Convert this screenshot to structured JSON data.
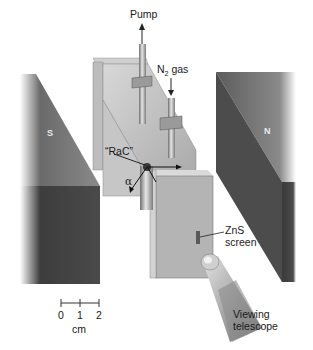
{
  "diagram": {
    "labels": {
      "pump": "Pump",
      "n2_gas_prefix": "N",
      "n2_gas_sub": "2",
      "n2_gas_suffix": " gas",
      "source": "“RaC”",
      "alpha": "α",
      "zns_line1": "ZnS",
      "zns_line2": "screen",
      "telescope_line1": "Viewing",
      "telescope_line2": "telescope",
      "magnet_south": "S",
      "magnet_north": "N"
    },
    "scale_bar": {
      "ticks": [
        "0",
        "1",
        "2"
      ],
      "unit": "cm"
    },
    "colors": {
      "magnet_top": "#7a7a7a",
      "magnet_side": "#4a4a4a",
      "chamber": "#b9b9b9",
      "chamber_dark": "#8f8f8f",
      "text": "#1a1a1a"
    }
  }
}
